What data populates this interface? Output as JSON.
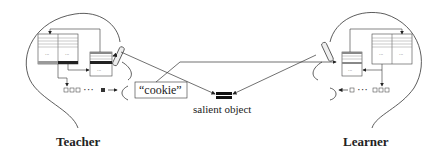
{
  "diagram": {
    "agents": [
      {
        "name": "Teacher",
        "side": "left"
      },
      {
        "name": "Learner",
        "side": "right"
      }
    ],
    "utterance": {
      "text": "“cookie”"
    },
    "object": {
      "label": "salient object"
    },
    "sequence": {
      "ellipsis": "···"
    },
    "cell_dots": "..."
  }
}
